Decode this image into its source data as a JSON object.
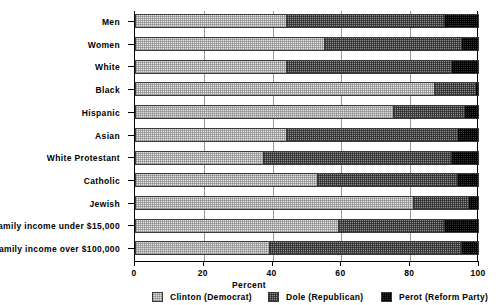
{
  "chart_data": {
    "type": "bar",
    "orientation": "horizontal",
    "stacked": true,
    "title": "",
    "xlabel": "Percent",
    "ylabel": "",
    "xlim": [
      0,
      100
    ],
    "xticks": [
      0,
      20,
      40,
      60,
      80,
      100
    ],
    "xticklabels": [
      "0",
      "20",
      "40",
      "60",
      "80",
      "100"
    ],
    "grid": true,
    "legend_position": "bottom",
    "categories": [
      "Men",
      "Women",
      "White",
      "Black",
      "Hispanic",
      "Asian",
      "White Protestant",
      "Catholic",
      "Jewish",
      "Family income under $15,000",
      "Family income over $100,000"
    ],
    "series": [
      {
        "name": "Clinton (Democrat)",
        "values": [
          44,
          55,
          44,
          87,
          75,
          44,
          37,
          53,
          81,
          59,
          39
        ]
      },
      {
        "name": "Dole (Republican)",
        "values": [
          46,
          40,
          48,
          12,
          21,
          50,
          55,
          41,
          16,
          31,
          56
        ]
      },
      {
        "name": "Perot (Reform Party)",
        "values": [
          10,
          5,
          8,
          1,
          4,
          6,
          8,
          6,
          3,
          10,
          5
        ]
      }
    ]
  },
  "legend": {
    "items": [
      {
        "label": "Clinton (Democrat)",
        "swatch": "light-dither"
      },
      {
        "label": "Dole (Republican)",
        "swatch": "medium-dither"
      },
      {
        "label": "Perot (Reform Party)",
        "swatch": "dark-dither"
      }
    ]
  },
  "colors": {
    "clinton": "#e6e6e6",
    "dole": "#8f8f8f",
    "perot": "#303030",
    "axis": "#000000",
    "grid": "#9a9a9a",
    "background": "#ffffff"
  }
}
